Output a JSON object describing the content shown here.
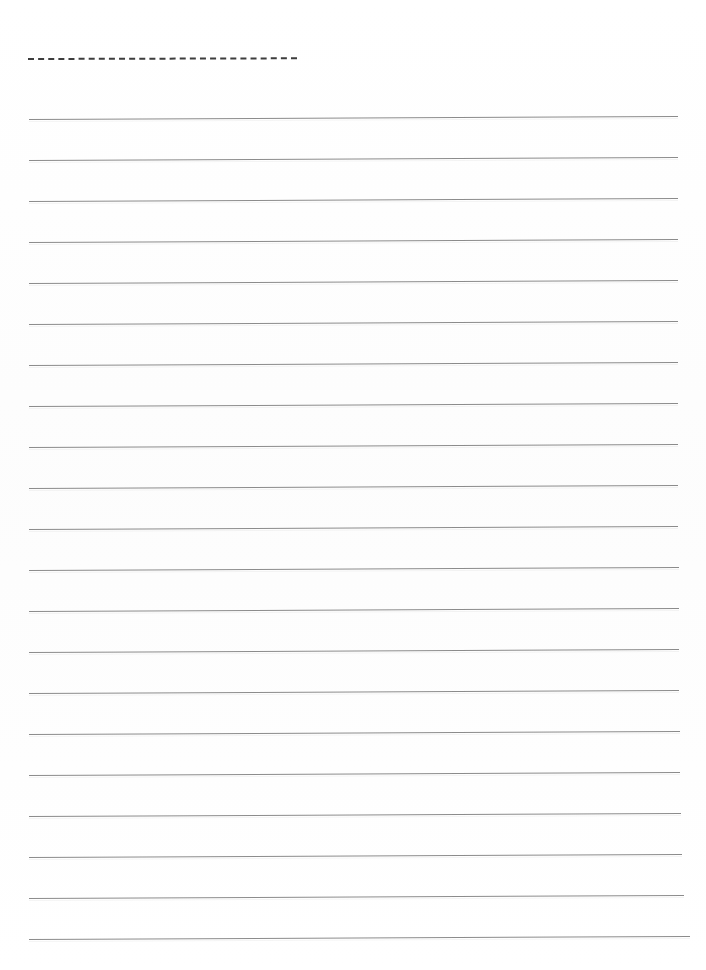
{
  "page": {
    "kind": "lined-notebook-paper-scan",
    "width": 706,
    "height": 970,
    "background_color": "#ffffff",
    "text_content": "",
    "note": "Blank ruled writing paper — no handwriting or printed text present"
  },
  "dashed_rule": {
    "label": "dashed-header-rule",
    "color": "#3d3d3d",
    "thickness_px": 2,
    "y": 58,
    "x_start": 28,
    "x_end": 297,
    "dash_length_px": 3,
    "gap_length_px": 2,
    "tilt_deg": -0.15
  },
  "ruled_lines": {
    "label": "ruled-writing-lines",
    "color": "#8b8b8b",
    "thickness_px": 1,
    "count": 21,
    "x_start": 29,
    "x_end": 679,
    "spacing_px": 40.9,
    "tilt_deg": -0.26,
    "lines": [
      {
        "index": 1,
        "y": 119,
        "x_start": 29,
        "x_end": 678
      },
      {
        "index": 2,
        "y": 160,
        "x_start": 29,
        "x_end": 678
      },
      {
        "index": 3,
        "y": 201,
        "x_start": 29,
        "x_end": 678
      },
      {
        "index": 4,
        "y": 242,
        "x_start": 29,
        "x_end": 678
      },
      {
        "index": 5,
        "y": 283,
        "x_start": 29,
        "x_end": 678
      },
      {
        "index": 6,
        "y": 324,
        "x_start": 29,
        "x_end": 678
      },
      {
        "index": 7,
        "y": 365,
        "x_start": 29,
        "x_end": 678
      },
      {
        "index": 8,
        "y": 406,
        "x_start": 29,
        "x_end": 678
      },
      {
        "index": 9,
        "y": 447,
        "x_start": 29,
        "x_end": 678
      },
      {
        "index": 10,
        "y": 488,
        "x_start": 29,
        "x_end": 678
      },
      {
        "index": 11,
        "y": 529,
        "x_start": 29,
        "x_end": 678
      },
      {
        "index": 12,
        "y": 570,
        "x_start": 29,
        "x_end": 679
      },
      {
        "index": 13,
        "y": 611,
        "x_start": 29,
        "x_end": 679
      },
      {
        "index": 14,
        "y": 652,
        "x_start": 29,
        "x_end": 679
      },
      {
        "index": 15,
        "y": 693,
        "x_start": 29,
        "x_end": 679
      },
      {
        "index": 16,
        "y": 734,
        "x_start": 29,
        "x_end": 680
      },
      {
        "index": 17,
        "y": 775,
        "x_start": 29,
        "x_end": 680
      },
      {
        "index": 18,
        "y": 816,
        "x_start": 29,
        "x_end": 681
      },
      {
        "index": 19,
        "y": 857,
        "x_start": 29,
        "x_end": 682
      },
      {
        "index": 20,
        "y": 898,
        "x_start": 29,
        "x_end": 684
      },
      {
        "index": 21,
        "y": 939,
        "x_start": 29,
        "x_end": 690
      }
    ]
  }
}
